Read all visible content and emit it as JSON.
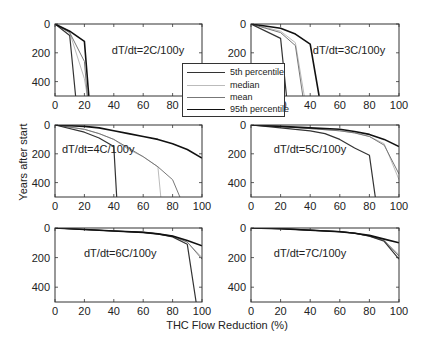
{
  "chart_data": {
    "type": "line",
    "xlabel": "THC Flow Reduction (%)",
    "ylabel": "Years after start",
    "xlim": [
      0,
      100
    ],
    "ylim": [
      0,
      500
    ],
    "y_inverted": true,
    "xticks": [
      0,
      20,
      40,
      60,
      80,
      100
    ],
    "yticks": [
      0,
      200,
      400
    ],
    "legend": {
      "position": "center",
      "entries": [
        {
          "name": "5th percentile",
          "color": "#333333",
          "width": 1.2
        },
        {
          "name": "median",
          "color": "#bbbbbb",
          "width": 1.0
        },
        {
          "name": "mean",
          "color": "#777777",
          "width": 1.0
        },
        {
          "name": "95th percentile",
          "color": "#111111",
          "width": 1.6
        }
      ]
    },
    "panels": [
      {
        "title": "dT/dt=2C/100y",
        "series": [
          {
            "name": "5th percentile",
            "x": [
              0,
              10,
              14
            ],
            "y": [
              0,
              80,
              500
            ]
          },
          {
            "name": "median",
            "x": [
              0,
              10,
              20,
              22
            ],
            "y": [
              0,
              60,
              380,
              500
            ]
          },
          {
            "name": "mean",
            "x": [
              0,
              10,
              20,
              22
            ],
            "y": [
              0,
              60,
              260,
              500
            ]
          },
          {
            "name": "95th percentile",
            "x": [
              0,
              10,
              20,
              23
            ],
            "y": [
              0,
              50,
              120,
              500
            ]
          }
        ]
      },
      {
        "title": "dT/dt=3C/100y",
        "series": [
          {
            "name": "5th percentile",
            "x": [
              0,
              20,
              24
            ],
            "y": [
              0,
              100,
              500
            ]
          },
          {
            "name": "median",
            "x": [
              0,
              20,
              30,
              36
            ],
            "y": [
              0,
              50,
              130,
              500
            ]
          },
          {
            "name": "mean",
            "x": [
              0,
              20,
              30,
              35
            ],
            "y": [
              0,
              60,
              150,
              500
            ]
          },
          {
            "name": "95th percentile",
            "x": [
              0,
              20,
              30,
              40,
              46
            ],
            "y": [
              0,
              30,
              70,
              140,
              500
            ]
          }
        ]
      },
      {
        "title": "dT/dt=4C/100y",
        "series": [
          {
            "name": "5th percentile",
            "x": [
              0,
              20,
              30,
              40,
              42
            ],
            "y": [
              0,
              50,
              90,
              150,
              500
            ]
          },
          {
            "name": "median",
            "x": [
              0,
              20,
              30,
              40,
              50,
              60,
              70,
              72
            ],
            "y": [
              0,
              30,
              60,
              100,
              170,
              220,
              290,
              500
            ]
          },
          {
            "name": "mean",
            "x": [
              0,
              20,
              30,
              40,
              50,
              60,
              70,
              80,
              85
            ],
            "y": [
              0,
              30,
              60,
              100,
              160,
              220,
              290,
              380,
              500
            ]
          },
          {
            "name": "95th percentile",
            "x": [
              0,
              20,
              30,
              40,
              50,
              60,
              70,
              80,
              90,
              100
            ],
            "y": [
              0,
              10,
              20,
              40,
              60,
              80,
              100,
              130,
              170,
              230
            ]
          }
        ]
      },
      {
        "title": "dT/dt=5C/100y",
        "series": [
          {
            "name": "5th percentile",
            "x": [
              0,
              20,
              40,
              50,
              60,
              70,
              80,
              84
            ],
            "y": [
              0,
              20,
              40,
              60,
              100,
              160,
              210,
              500
            ]
          },
          {
            "name": "median",
            "x": [
              0,
              20,
              40,
              60,
              70,
              80,
              90,
              100
            ],
            "y": [
              0,
              10,
              25,
              40,
              55,
              80,
              130,
              380
            ]
          },
          {
            "name": "mean",
            "x": [
              0,
              20,
              40,
              60,
              70,
              80,
              90,
              100
            ],
            "y": [
              0,
              10,
              25,
              40,
              55,
              80,
              140,
              340
            ]
          },
          {
            "name": "95th percentile",
            "x": [
              0,
              20,
              40,
              60,
              70,
              80,
              90,
              100
            ],
            "y": [
              0,
              10,
              20,
              30,
              45,
              65,
              100,
              150
            ]
          }
        ]
      },
      {
        "title": "dT/dt=6C/100y",
        "series": [
          {
            "name": "5th percentile",
            "x": [
              0,
              20,
              40,
              60,
              70,
              80,
              90,
              96
            ],
            "y": [
              0,
              10,
              20,
              30,
              40,
              60,
              110,
              500
            ]
          },
          {
            "name": "median",
            "x": [
              0,
              20,
              40,
              60,
              70,
              80,
              90,
              100
            ],
            "y": [
              0,
              10,
              20,
              30,
              40,
              55,
              95,
              200
            ]
          },
          {
            "name": "mean",
            "x": [
              0,
              20,
              40,
              60,
              70,
              80,
              90,
              100
            ],
            "y": [
              0,
              10,
              20,
              30,
              40,
              55,
              95,
              210
            ]
          },
          {
            "name": "95th percentile",
            "x": [
              0,
              20,
              40,
              60,
              70,
              80,
              90,
              100
            ],
            "y": [
              0,
              10,
              20,
              30,
              40,
              55,
              85,
              120
            ]
          }
        ]
      },
      {
        "title": "dT/dt=7C/100y",
        "series": [
          {
            "name": "5th percentile",
            "x": [
              0,
              20,
              40,
              60,
              70,
              80,
              90,
              100
            ],
            "y": [
              0,
              5,
              15,
              25,
              35,
              55,
              90,
              210
            ]
          },
          {
            "name": "median",
            "x": [
              0,
              20,
              40,
              60,
              70,
              80,
              90,
              100
            ],
            "y": [
              0,
              5,
              15,
              25,
              35,
              55,
              85,
              180
            ]
          },
          {
            "name": "mean",
            "x": [
              0,
              20,
              40,
              60,
              70,
              80,
              90,
              100
            ],
            "y": [
              0,
              5,
              15,
              25,
              35,
              55,
              85,
              190
            ]
          },
          {
            "name": "95th percentile",
            "x": [
              0,
              20,
              40,
              60,
              70,
              80,
              90,
              100
            ],
            "y": [
              0,
              5,
              15,
              25,
              35,
              50,
              75,
              100
            ]
          }
        ]
      }
    ]
  }
}
